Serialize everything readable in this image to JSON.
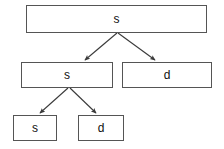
{
  "diagram": {
    "type": "parse-tree",
    "title": "",
    "background_color": "#ffffff",
    "border_color": "#555555",
    "text_color": "#111111",
    "edge_color": "#3a3a3a",
    "nodes": [
      {
        "id": "root",
        "label": "s",
        "level": 0,
        "x": 26,
        "y": 5,
        "width": 181,
        "height": 28
      },
      {
        "id": "l1-left",
        "label": "s",
        "level": 1,
        "x": 21,
        "y": 62,
        "width": 92,
        "height": 26
      },
      {
        "id": "l1-right",
        "label": "d",
        "level": 1,
        "x": 122,
        "y": 62,
        "width": 90,
        "height": 26
      },
      {
        "id": "l2-left",
        "label": "s",
        "level": 2,
        "x": 13,
        "y": 115,
        "width": 44,
        "height": 26
      },
      {
        "id": "l2-right",
        "label": "d",
        "level": 2,
        "x": 78,
        "y": 115,
        "width": 46,
        "height": 26
      }
    ],
    "edges": [
      {
        "id": "edge-root-to-l1-left",
        "from": "root",
        "to": "l1-left",
        "x1": 117,
        "y1": 33,
        "x2": 84,
        "y2": 61
      },
      {
        "id": "edge-root-to-l1-right",
        "from": "root",
        "to": "l1-right",
        "x1": 118,
        "y1": 33,
        "x2": 156,
        "y2": 61
      },
      {
        "id": "edge-l1-left-to-l2-left",
        "from": "l1-left",
        "to": "l2-left",
        "x1": 68,
        "y1": 88,
        "x2": 39,
        "y2": 114
      },
      {
        "id": "edge-l1-left-to-l2-right",
        "from": "l1-left",
        "to": "l2-right",
        "x1": 70,
        "y1": 88,
        "x2": 97,
        "y2": 114
      }
    ]
  }
}
